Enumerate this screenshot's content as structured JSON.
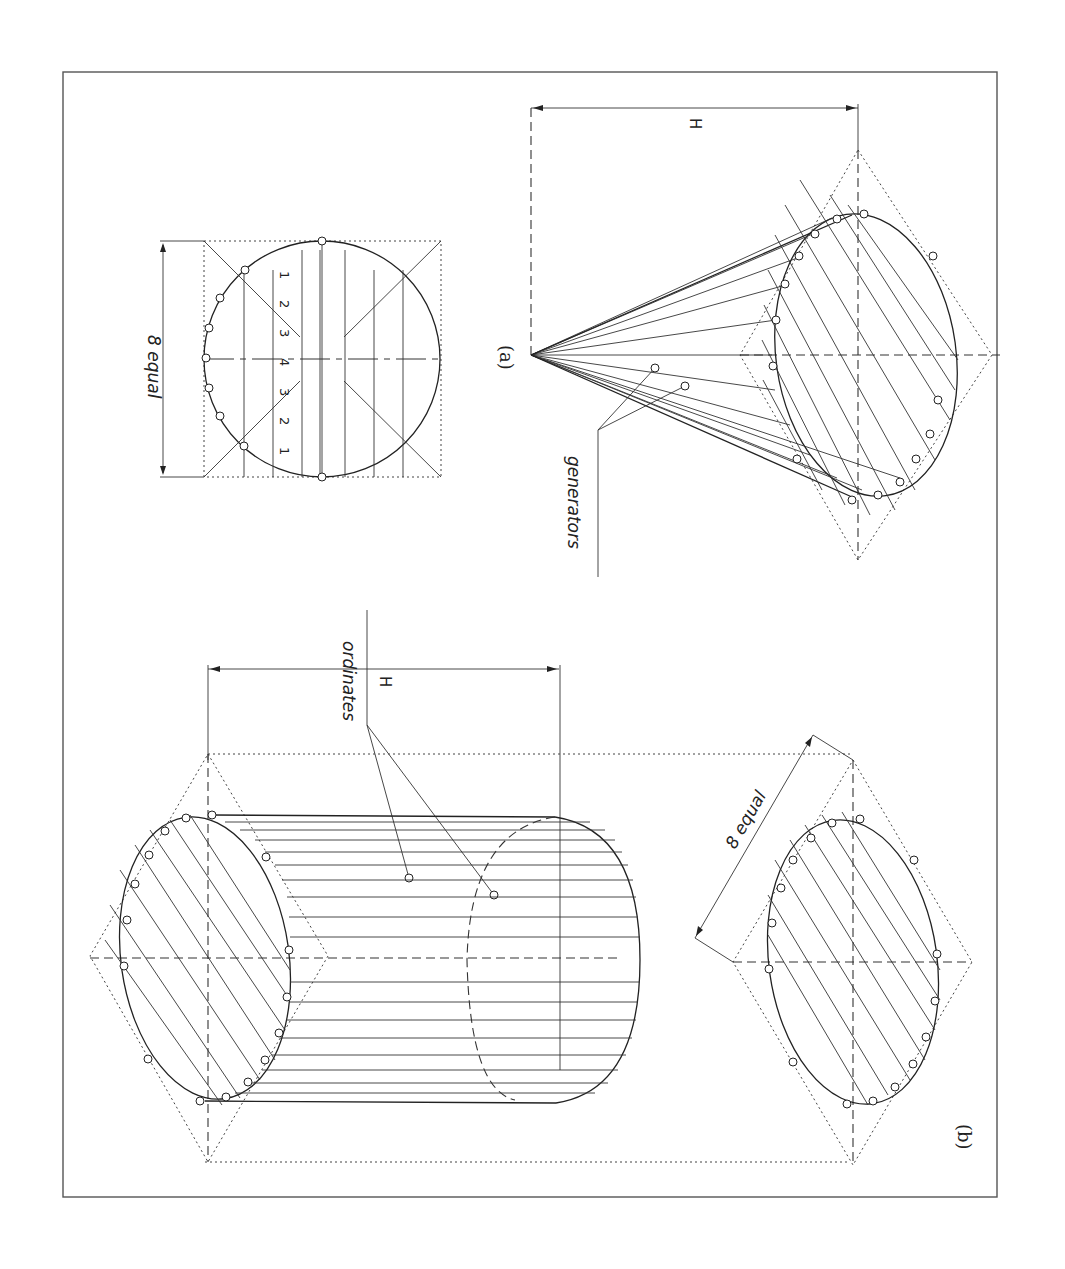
{
  "figure": {
    "orientation": "rotated 90 degrees clockwise on page",
    "panels": [
      {
        "id": "a",
        "caption": "(a)",
        "description": "Oblique cone drawn from a plan circle divided into 8 equal parts with generators",
        "labels": {
          "divisions": "8 equal",
          "height": "H",
          "generators": "generators"
        },
        "ordinate_numbers": [
          "1",
          "2",
          "3",
          "4",
          "3",
          "2",
          "1"
        ]
      },
      {
        "id": "b",
        "caption": "(b)",
        "description": "Oblique cylinder drawn with ordinates from an ellipse divided into 8 equal parts",
        "labels": {
          "divisions": "8 equal",
          "height": "H",
          "ordinates": "ordinates"
        },
        "ordinate_numbers": [
          "1",
          "2",
          "3",
          "4",
          "3",
          "2",
          "1"
        ]
      }
    ]
  },
  "colors": {
    "line": "#222222",
    "frame": "#555555",
    "background": "#ffffff"
  }
}
